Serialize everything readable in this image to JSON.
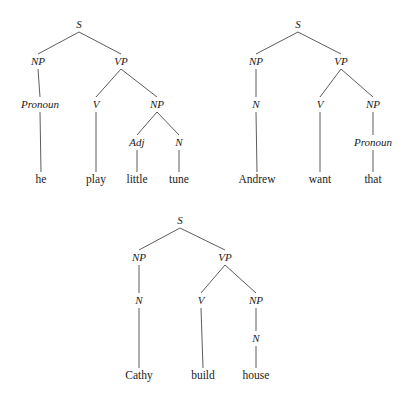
{
  "page": {
    "background_color": "#ffffff",
    "line_color": "#4a4a4a",
    "text_color": "#1b1b1b",
    "width": 409,
    "height": 400
  },
  "trees": [
    {
      "id": "tree-1",
      "sentence": "he play little tune",
      "nodes": [
        {
          "key": "s",
          "label": "S",
          "x": 79,
          "y": 28,
          "style": "italic"
        },
        {
          "key": "np1",
          "label": "NP",
          "x": 38,
          "y": 65,
          "style": "italic"
        },
        {
          "key": "vp",
          "label": "VP",
          "x": 121,
          "y": 65,
          "style": "italic"
        },
        {
          "key": "pronoun",
          "label": "Pronoun",
          "x": 40,
          "y": 108,
          "style": "italic"
        },
        {
          "key": "v",
          "label": "V",
          "x": 96,
          "y": 108,
          "style": "italic"
        },
        {
          "key": "np2",
          "label": "NP",
          "x": 157,
          "y": 108,
          "style": "italic"
        },
        {
          "key": "adj",
          "label": "Adj",
          "x": 137,
          "y": 146,
          "style": "italic"
        },
        {
          "key": "n",
          "label": "N",
          "x": 179,
          "y": 146,
          "style": "italic"
        }
      ],
      "leaves": [
        {
          "key": "leaf-he",
          "label": "he",
          "x": 41,
          "y": 183,
          "parent": "pronoun"
        },
        {
          "key": "leaf-play",
          "label": "play",
          "x": 96,
          "y": 183,
          "parent": "v"
        },
        {
          "key": "leaf-little",
          "label": "little",
          "x": 137,
          "y": 183,
          "parent": "adj"
        },
        {
          "key": "leaf-tune",
          "label": "tune",
          "x": 179,
          "y": 183,
          "parent": "n"
        }
      ],
      "edges": [
        {
          "from": "s",
          "to": "np1"
        },
        {
          "from": "s",
          "to": "vp"
        },
        {
          "from": "np1",
          "to": "pronoun"
        },
        {
          "from": "vp",
          "to": "v"
        },
        {
          "from": "vp",
          "to": "np2"
        },
        {
          "from": "np2",
          "to": "adj"
        },
        {
          "from": "np2",
          "to": "n"
        }
      ]
    },
    {
      "id": "tree-2",
      "sentence": "Andrew want that",
      "nodes": [
        {
          "key": "s",
          "label": "S",
          "x": 298,
          "y": 28,
          "style": "italic"
        },
        {
          "key": "np1",
          "label": "NP",
          "x": 256,
          "y": 65,
          "style": "italic"
        },
        {
          "key": "vp",
          "label": "VP",
          "x": 341,
          "y": 65,
          "style": "italic"
        },
        {
          "key": "n",
          "label": "N",
          "x": 256,
          "y": 108,
          "style": "italic"
        },
        {
          "key": "v",
          "label": "V",
          "x": 320,
          "y": 108,
          "style": "italic"
        },
        {
          "key": "np2",
          "label": "NP",
          "x": 373,
          "y": 108,
          "style": "italic"
        },
        {
          "key": "pronoun",
          "label": "Pronoun",
          "x": 373,
          "y": 146,
          "style": "italic"
        }
      ],
      "leaves": [
        {
          "key": "leaf-andrew",
          "label": "Andrew",
          "x": 257,
          "y": 183,
          "parent": "n"
        },
        {
          "key": "leaf-want",
          "label": "want",
          "x": 320,
          "y": 183,
          "parent": "v"
        },
        {
          "key": "leaf-that",
          "label": "that",
          "x": 373,
          "y": 183,
          "parent": "pronoun"
        }
      ],
      "edges": [
        {
          "from": "s",
          "to": "np1"
        },
        {
          "from": "s",
          "to": "vp"
        },
        {
          "from": "np1",
          "to": "n"
        },
        {
          "from": "vp",
          "to": "v"
        },
        {
          "from": "vp",
          "to": "np2"
        },
        {
          "from": "np2",
          "to": "pronoun"
        }
      ]
    },
    {
      "id": "tree-3",
      "sentence": "Cathy build house",
      "nodes": [
        {
          "key": "s",
          "label": "S",
          "x": 180,
          "y": 224,
          "style": "italic"
        },
        {
          "key": "np1",
          "label": "NP",
          "x": 139,
          "y": 261,
          "style": "italic"
        },
        {
          "key": "vp",
          "label": "VP",
          "x": 225,
          "y": 261,
          "style": "italic"
        },
        {
          "key": "n1",
          "label": "N",
          "x": 139,
          "y": 304,
          "style": "italic"
        },
        {
          "key": "v",
          "label": "V",
          "x": 201,
          "y": 304,
          "style": "italic"
        },
        {
          "key": "np2",
          "label": "NP",
          "x": 256,
          "y": 304,
          "style": "italic"
        },
        {
          "key": "n2",
          "label": "N",
          "x": 256,
          "y": 342,
          "style": "italic"
        }
      ],
      "leaves": [
        {
          "key": "leaf-cathy",
          "label": "Cathy",
          "x": 139,
          "y": 379,
          "parent": "n1"
        },
        {
          "key": "leaf-build",
          "label": "build",
          "x": 203,
          "y": 379,
          "parent": "v"
        },
        {
          "key": "leaf-house",
          "label": "house",
          "x": 256,
          "y": 379,
          "parent": "n2"
        }
      ],
      "edges": [
        {
          "from": "s",
          "to": "np1"
        },
        {
          "from": "s",
          "to": "vp"
        },
        {
          "from": "np1",
          "to": "n1"
        },
        {
          "from": "vp",
          "to": "v"
        },
        {
          "from": "vp",
          "to": "np2"
        },
        {
          "from": "np2",
          "to": "n2"
        }
      ]
    }
  ]
}
